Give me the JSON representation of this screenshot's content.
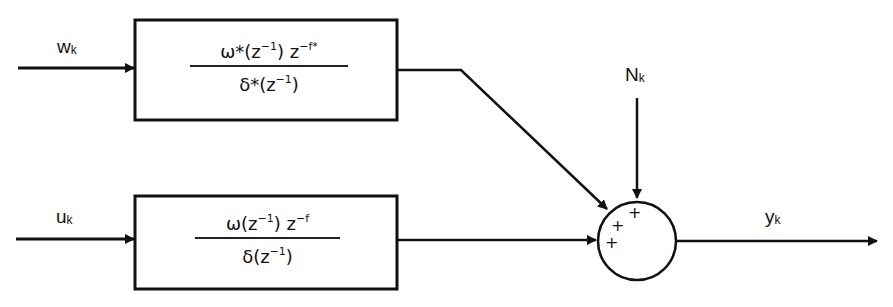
{
  "diagram": {
    "type": "block-diagram",
    "inputs": {
      "top": {
        "label": "w",
        "subscript": "k"
      },
      "bottom": {
        "label": "u",
        "subscript": "k"
      },
      "noise": {
        "label": "N",
        "subscript": "k"
      }
    },
    "output": {
      "label": "y",
      "subscript": "k"
    },
    "blocks": [
      {
        "id": "noise-transfer-function",
        "numerator": {
          "main": "ω*(z",
          "exp1": "−1",
          "mid": ") z",
          "exp2": "−f*"
        },
        "denominator": {
          "main": "δ*(z",
          "exp1": "−1",
          "end": ")"
        }
      },
      {
        "id": "input-transfer-function",
        "numerator": {
          "main": "ω(z",
          "exp1": "−1",
          "mid": ") z",
          "exp2": "−f"
        },
        "denominator": {
          "main": "δ(z",
          "exp1": "−1",
          "end": ")"
        }
      }
    ],
    "summing_junction": {
      "signs": [
        "+",
        "+",
        "+"
      ]
    },
    "colors": {
      "stroke": "#111111",
      "background": "#ffffff"
    }
  }
}
